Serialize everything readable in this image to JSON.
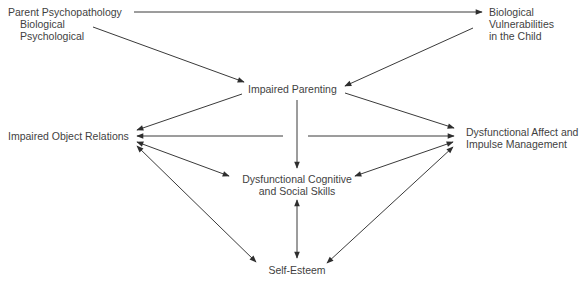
{
  "diagram": {
    "type": "causal-flow",
    "nodes": {
      "parent_psychopathology": {
        "title": "Parent Psychopathology",
        "sub1": "Biological",
        "sub2": "Psychological"
      },
      "bio_vulnerabilities": {
        "line1": "Biological",
        "line2": "Vulnerabilities",
        "line3": "in the Child"
      },
      "impaired_parenting": {
        "label": "Impaired Parenting"
      },
      "impaired_object_relations": {
        "label": "Impaired Object Relations"
      },
      "dysfunctional_affect": {
        "line1": "Dysfunctional Affect and",
        "line2": "Impulse Management"
      },
      "dysfunctional_cognitive": {
        "line1": "Dysfunctional Cognitive",
        "line2": "and Social Skills"
      },
      "self_esteem": {
        "label": "Self-Esteem"
      }
    },
    "edges": [
      {
        "from": "Parent Psychopathology",
        "to": "Biological Vulnerabilities in the Child",
        "direction": "one-way"
      },
      {
        "from": "Parent Psychopathology",
        "to": "Impaired Parenting",
        "direction": "one-way"
      },
      {
        "from": "Biological Vulnerabilities in the Child",
        "to": "Impaired Parenting",
        "direction": "one-way"
      },
      {
        "from": "Impaired Parenting",
        "to": "Impaired Object Relations",
        "direction": "one-way"
      },
      {
        "from": "Impaired Parenting",
        "to": "Dysfunctional Affect and Impulse Management",
        "direction": "one-way"
      },
      {
        "from": "Impaired Parenting",
        "to": "Impaired Object Relations",
        "direction": "one-way",
        "style": "horizontal"
      },
      {
        "from": "Impaired Parenting",
        "to": "Dysfunctional Affect and Impulse Management",
        "direction": "one-way",
        "style": "horizontal"
      },
      {
        "from": "Impaired Parenting",
        "to": "Dysfunctional Cognitive and Social Skills",
        "direction": "one-way"
      },
      {
        "from": "Impaired Object Relations",
        "to": "Dysfunctional Cognitive and Social Skills",
        "direction": "two-way"
      },
      {
        "from": "Impaired Object Relations",
        "to": "Self-Esteem",
        "direction": "two-way"
      },
      {
        "from": "Dysfunctional Affect and Impulse Management",
        "to": "Dysfunctional Cognitive and Social Skills",
        "direction": "two-way"
      },
      {
        "from": "Dysfunctional Affect and Impulse Management",
        "to": "Self-Esteem",
        "direction": "two-way"
      },
      {
        "from": "Dysfunctional Cognitive and Social Skills",
        "to": "Self-Esteem",
        "direction": "two-way"
      }
    ],
    "colors": {
      "line": "#3a3a3a",
      "text": "#3f3f3f",
      "background": "#ffffff"
    }
  }
}
